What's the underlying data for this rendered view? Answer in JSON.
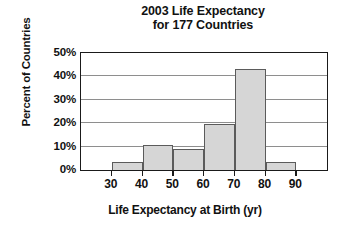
{
  "chart_data": {
    "type": "bar",
    "title": "2003 Life Expectancy for 177 Countries",
    "title_lines": [
      "2003 Life Expectancy",
      "for 177 Countries"
    ],
    "xlabel": "Life Expectancy at Birth (yr)",
    "ylabel": "Percent of Countries",
    "categories": [
      "30-40",
      "40-50",
      "50-60",
      "60-70",
      "70-80",
      "80-90"
    ],
    "bin_edges": [
      30,
      40,
      50,
      60,
      70,
      80,
      90
    ],
    "values": [
      3.5,
      10.8,
      9.0,
      19.5,
      43.0,
      3.5
    ],
    "xlim": [
      20,
      100
    ],
    "ylim": [
      0,
      50
    ],
    "xticks": [
      30,
      40,
      50,
      60,
      70,
      80,
      90
    ],
    "xtick_labels": [
      "30",
      "40",
      "50",
      "60",
      "70",
      "80",
      "90"
    ],
    "yticks": [
      0,
      10,
      20,
      30,
      40,
      50
    ],
    "ytick_labels": [
      "0%",
      "10%",
      "20%",
      "30%",
      "40%",
      "50%"
    ],
    "grid": "horizontal",
    "legend": null,
    "bar_fill_color": "#d6d6d6",
    "bar_edge_color": "#5b5b5b",
    "gridline_color": "#8e8e8e",
    "frame_color": "#1a1a1a",
    "background_color": "#ffffff"
  }
}
